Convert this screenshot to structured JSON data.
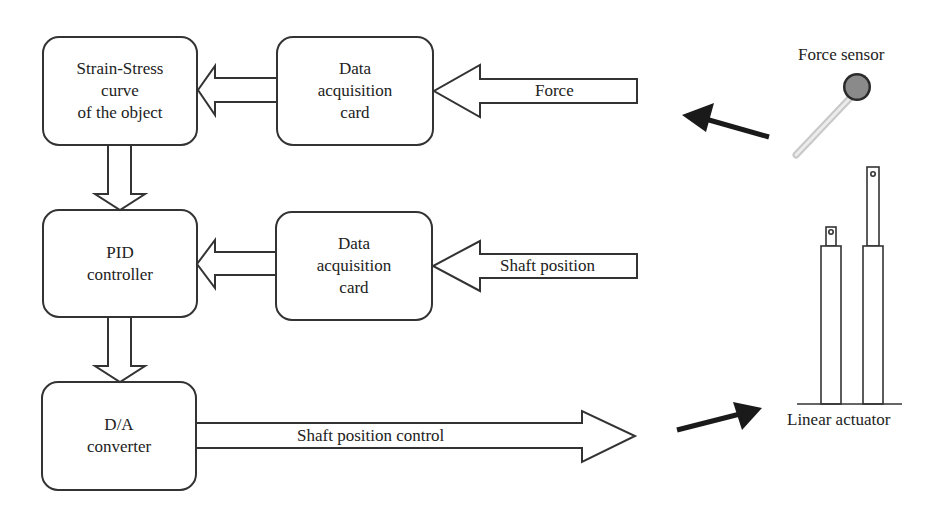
{
  "blocks": {
    "strain_stress": {
      "lines": [
        "Strain-Stress",
        "curve",
        "of the object"
      ]
    },
    "daq_force": {
      "lines": [
        "Data",
        "acquisition",
        "card"
      ]
    },
    "pid": {
      "lines": [
        "PID",
        "controller"
      ]
    },
    "daq_position": {
      "lines": [
        "Data",
        "acquisition",
        "card"
      ]
    },
    "da_converter": {
      "lines": [
        "D/A",
        "converter"
      ]
    }
  },
  "signals": {
    "force": "Force",
    "shaft_position": "Shaft position",
    "shaft_position_control": "Shaft position control"
  },
  "devices": {
    "force_sensor": "Force sensor",
    "linear_actuator": "Linear actuator"
  },
  "colors": {
    "stroke": "#333333",
    "sensor_disc": "#8a8a8a",
    "sensor_rim": "#2a2a2a",
    "sensor_tail": "#d8d8d8",
    "pointer_arrow": "#1a1a1a"
  }
}
